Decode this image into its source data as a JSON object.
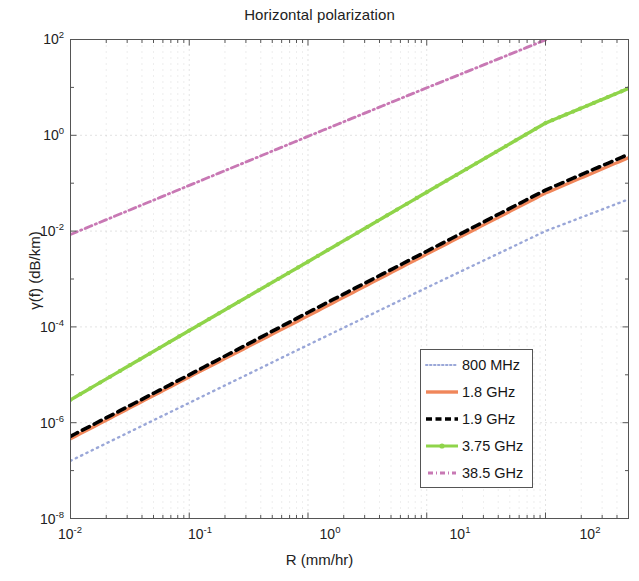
{
  "chart_data": {
    "type": "line",
    "title": "Horizontal polarization",
    "xlabel": "R (mm/hr)",
    "ylabel": "γ(f) (dB/km)",
    "xscale": "log",
    "yscale": "log",
    "xlim": [
      0.01,
      500
    ],
    "ylim": [
      1e-08,
      100
    ],
    "xticks": [
      "10⁻²",
      "10⁻¹",
      "10⁰",
      "10¹",
      "10²"
    ],
    "xtick_values": [
      0.01,
      0.1,
      1,
      10,
      100
    ],
    "yticks": [
      "10²",
      "10⁰",
      "10⁻²",
      "10⁻⁴",
      "10⁻⁶",
      "10⁻⁸"
    ],
    "ytick_values": [
      100,
      1,
      0.01,
      0.0001,
      1e-06,
      1e-08
    ],
    "grid": true,
    "grid_style": "dotted",
    "legend_position": "lower right",
    "series": [
      {
        "name": "800 MHz",
        "color": "#9aa7d8",
        "style": "dotted",
        "marker": "none",
        "x": [
          0.01,
          0.1,
          1,
          10,
          100,
          500
        ],
        "y": [
          1.6e-07,
          2.6e-06,
          4.2e-05,
          0.00066,
          0.01,
          0.046
        ]
      },
      {
        "name": "1.8 GHz",
        "color": "#f0865a",
        "style": "solid",
        "marker": "none",
        "x": [
          0.01,
          0.1,
          1,
          10,
          100,
          500
        ],
        "y": [
          4.6e-07,
          9e-06,
          0.00017,
          0.0033,
          0.062,
          0.34
        ]
      },
      {
        "name": "1.9 GHz",
        "color": "#000000",
        "style": "dashed",
        "marker": "none",
        "x": [
          0.01,
          0.1,
          1,
          10,
          100,
          500
        ],
        "y": [
          5.2e-07,
          1e-05,
          0.0002,
          0.0038,
          0.072,
          0.4
        ]
      },
      {
        "name": "3.75 GHz",
        "color": "#8fd44a",
        "style": "solid",
        "marker": "dot",
        "x": [
          0.01,
          0.1,
          1,
          10,
          100,
          500
        ],
        "y": [
          3e-06,
          8.4e-05,
          0.0023,
          0.065,
          1.8,
          9.5
        ]
      },
      {
        "name": "38.5 GHz",
        "color": "#c878b4",
        "style": "dashdot",
        "marker": "none",
        "x": [
          0.01,
          0.1,
          1,
          10,
          100,
          210
        ],
        "y": [
          0.0085,
          0.09,
          0.95,
          9.8,
          98,
          200
        ]
      }
    ]
  },
  "legend": {
    "items": [
      {
        "label": "800 MHz"
      },
      {
        "label": "1.8 GHz"
      },
      {
        "label": "1.9 GHz"
      },
      {
        "label": "3.75 GHz"
      },
      {
        "label": "38.5 GHz"
      }
    ]
  },
  "yticks_display": [
    {
      "base": "10",
      "exp": "2"
    },
    {
      "base": "10",
      "exp": "0"
    },
    {
      "base": "10",
      "exp": "-2"
    },
    {
      "base": "10",
      "exp": "-4"
    },
    {
      "base": "10",
      "exp": "-6"
    },
    {
      "base": "10",
      "exp": "-8"
    }
  ],
  "xticks_display": [
    {
      "base": "10",
      "exp": "-2"
    },
    {
      "base": "10",
      "exp": "-1"
    },
    {
      "base": "10",
      "exp": "0"
    },
    {
      "base": "10",
      "exp": "1"
    },
    {
      "base": "10",
      "exp": "2"
    }
  ]
}
